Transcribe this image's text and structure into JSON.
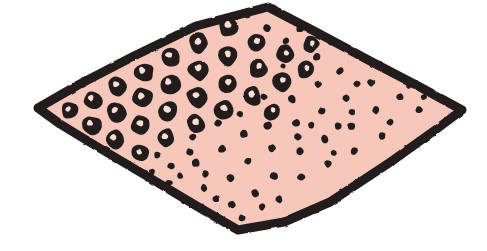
{
  "figure": {
    "canvas": {
      "width": 487,
      "height": 251,
      "background": "#ffffff"
    }
  },
  "colors": {
    "background": "#ffffff",
    "fill": "#f7c9bc",
    "fill_shade": "#f2bfb1",
    "ink": "#231c1a",
    "ink_soft": "#2b2220",
    "hole": "#fbded5"
  },
  "style": {
    "outline_width": 9,
    "ring_outline_width": 5,
    "dot_radius_min": 3,
    "dot_radius_max": 4.6,
    "ring_radius_min": 7,
    "ring_radius_max": 11
  },
  "shape": {
    "name": "rhombus-outline",
    "vertices": [
      {
        "label": "top",
        "x": 268,
        "y": 7
      },
      {
        "label": "right",
        "x": 462,
        "y": 110
      },
      {
        "label": "bottom",
        "x": 238,
        "y": 230
      },
      {
        "label": "left",
        "x": 38,
        "y": 108
      }
    ],
    "path": "M268,7 L316,32 L372,62 L420,87 L462,110 L438,128 L392,161 L330,202 L284,222 L238,230 L200,208 L150,178 L96,146 L60,124 L38,108 L78,85 L134,56 L196,26 Z"
  },
  "legend": {
    "ring_region_label": "annular marks",
    "dot_region_label": "punctate marks"
  },
  "chart_data": {
    "type": "scatter",
    "xlabel": "",
    "ylabel": "",
    "series": [
      {
        "name": "annular marks",
        "marker": "ring",
        "count": 47,
        "points": [
          {
            "x": 228,
            "y": 27,
            "r": 10.0,
            "hx": 228,
            "hy": 25,
            "hr": 3.3
          },
          {
            "x": 199,
            "y": 43,
            "r": 10.2,
            "hx": 198,
            "hy": 41,
            "hr": 3.4
          },
          {
            "x": 256,
            "y": 42,
            "r": 9.6,
            "hx": 257,
            "hy": 41,
            "hr": 3.1
          },
          {
            "x": 171,
            "y": 57,
            "r": 10.4,
            "hx": 169,
            "hy": 55,
            "hr": 3.5
          },
          {
            "x": 228,
            "y": 56,
            "r": 10.0,
            "hx": 228,
            "hy": 54,
            "hr": 3.3
          },
          {
            "x": 285,
            "y": 54,
            "r": 9.4,
            "hx": 286,
            "hy": 53,
            "hr": 3.0
          },
          {
            "x": 144,
            "y": 72,
            "r": 10.2,
            "hx": 142,
            "hy": 70,
            "hr": 3.4
          },
          {
            "x": 199,
            "y": 70,
            "r": 10.6,
            "hx": 198,
            "hy": 68,
            "hr": 3.5
          },
          {
            "x": 258,
            "y": 68,
            "r": 9.8,
            "hx": 259,
            "hy": 66,
            "hr": 3.2
          },
          {
            "x": 306,
            "y": 70,
            "r": 9.2,
            "hx": 307,
            "hy": 68,
            "hr": 2.9
          },
          {
            "x": 118,
            "y": 86,
            "r": 9.8,
            "hx": 116,
            "hy": 84,
            "hr": 3.2
          },
          {
            "x": 170,
            "y": 84,
            "r": 10.6,
            "hx": 168,
            "hy": 82,
            "hr": 3.5
          },
          {
            "x": 228,
            "y": 84,
            "r": 10.2,
            "hx": 228,
            "hy": 82,
            "hr": 3.4
          },
          {
            "x": 282,
            "y": 82,
            "r": 9.6,
            "hx": 283,
            "hy": 80,
            "hr": 3.1
          },
          {
            "x": 93,
            "y": 100,
            "r": 9.4,
            "hx": 91,
            "hy": 98,
            "hr": 3.0
          },
          {
            "x": 143,
            "y": 98,
            "r": 10.4,
            "hx": 141,
            "hy": 96,
            "hr": 3.4
          },
          {
            "x": 197,
            "y": 97,
            "r": 10.8,
            "hx": 196,
            "hy": 95,
            "hr": 3.6
          },
          {
            "x": 252,
            "y": 96,
            "r": 10.2,
            "hx": 252,
            "hy": 94,
            "hr": 3.4
          },
          {
            "x": 70,
            "y": 110,
            "r": 9.0,
            "hx": 68,
            "hy": 109,
            "hr": 2.9
          },
          {
            "x": 117,
            "y": 112,
            "r": 10.0,
            "hx": 115,
            "hy": 110,
            "hr": 3.3
          },
          {
            "x": 168,
            "y": 111,
            "r": 10.6,
            "hx": 167,
            "hy": 109,
            "hr": 3.5
          },
          {
            "x": 224,
            "y": 110,
            "r": 10.4,
            "hx": 224,
            "hy": 108,
            "hr": 3.4
          },
          {
            "x": 92,
            "y": 125,
            "r": 9.6,
            "hx": 90,
            "hy": 123,
            "hr": 3.1
          },
          {
            "x": 141,
            "y": 125,
            "r": 10.2,
            "hx": 140,
            "hy": 123,
            "hr": 3.4
          },
          {
            "x": 196,
            "y": 124,
            "r": 10.0,
            "hx": 196,
            "hy": 122,
            "hr": 3.3
          },
          {
            "x": 114,
            "y": 139,
            "r": 9.8,
            "hx": 113,
            "hy": 137,
            "hr": 3.2
          },
          {
            "x": 166,
            "y": 138,
            "r": 9.6,
            "hx": 165,
            "hy": 136,
            "hr": 3.1
          },
          {
            "x": 140,
            "y": 153,
            "r": 9.2,
            "hx": 139,
            "hy": 152,
            "hr": 3.0
          },
          {
            "x": 311,
            "y": 44,
            "r": 8.4,
            "hx": 312,
            "hy": 43,
            "hr": 2.6
          },
          {
            "x": 272,
            "y": 112,
            "r": 8.6,
            "hx": 273,
            "hy": 110,
            "hr": 2.7
          }
        ]
      },
      {
        "name": "punctate marks",
        "marker": "dot",
        "count": 62,
        "points": [
          {
            "x": 247,
            "y": 14,
            "r": 4.0
          },
          {
            "x": 267,
            "y": 28,
            "r": 3.8
          },
          {
            "x": 286,
            "y": 41,
            "r": 3.6
          },
          {
            "x": 300,
            "y": 29,
            "r": 3.5
          },
          {
            "x": 317,
            "y": 57,
            "r": 3.9
          },
          {
            "x": 340,
            "y": 71,
            "r": 3.8
          },
          {
            "x": 363,
            "y": 57,
            "r": 3.6
          },
          {
            "x": 338,
            "y": 43,
            "r": 3.5
          },
          {
            "x": 371,
            "y": 83,
            "r": 3.9
          },
          {
            "x": 394,
            "y": 69,
            "r": 3.7
          },
          {
            "x": 318,
            "y": 84,
            "r": 4.0
          },
          {
            "x": 292,
            "y": 99,
            "r": 4.2
          },
          {
            "x": 346,
            "y": 98,
            "r": 3.8
          },
          {
            "x": 376,
            "y": 110,
            "r": 4.0
          },
          {
            "x": 400,
            "y": 97,
            "r": 3.7
          },
          {
            "x": 419,
            "y": 110,
            "r": 3.6
          },
          {
            "x": 268,
            "y": 126,
            "r": 4.3
          },
          {
            "x": 296,
            "y": 123,
            "r": 3.9
          },
          {
            "x": 322,
            "y": 111,
            "r": 3.8
          },
          {
            "x": 351,
            "y": 126,
            "r": 4.0
          },
          {
            "x": 382,
            "y": 136,
            "r": 3.8
          },
          {
            "x": 354,
            "y": 151,
            "r": 3.9
          },
          {
            "x": 325,
            "y": 139,
            "r": 4.1
          },
          {
            "x": 300,
            "y": 151,
            "r": 4.0
          },
          {
            "x": 272,
            "y": 148,
            "r": 3.9
          },
          {
            "x": 244,
            "y": 134,
            "r": 4.2
          },
          {
            "x": 222,
            "y": 149,
            "r": 4.1
          },
          {
            "x": 196,
            "y": 163,
            "r": 4.0
          },
          {
            "x": 171,
            "y": 166,
            "r": 3.8
          },
          {
            "x": 248,
            "y": 161,
            "r": 4.0
          },
          {
            "x": 274,
            "y": 176,
            "r": 4.1
          },
          {
            "x": 301,
            "y": 177,
            "r": 3.9
          },
          {
            "x": 328,
            "y": 164,
            "r": 3.8
          },
          {
            "x": 230,
            "y": 178,
            "r": 4.0
          },
          {
            "x": 204,
            "y": 188,
            "r": 3.8
          },
          {
            "x": 255,
            "y": 193,
            "r": 4.0
          },
          {
            "x": 279,
            "y": 199,
            "r": 3.9
          },
          {
            "x": 232,
            "y": 205,
            "r": 4.0
          },
          {
            "x": 216,
            "y": 199,
            "r": 3.6
          },
          {
            "x": 242,
            "y": 218,
            "r": 3.7
          },
          {
            "x": 169,
            "y": 183,
            "r": 3.6
          },
          {
            "x": 190,
            "y": 152,
            "r": 3.7
          },
          {
            "x": 218,
            "y": 123,
            "r": 3.8
          },
          {
            "x": 193,
            "y": 137,
            "r": 3.6
          },
          {
            "x": 157,
            "y": 155,
            "r": 3.4
          },
          {
            "x": 152,
            "y": 172,
            "r": 3.3
          },
          {
            "x": 338,
            "y": 126,
            "r": 3.5
          },
          {
            "x": 409,
            "y": 85,
            "r": 3.4
          },
          {
            "x": 424,
            "y": 97,
            "r": 3.3
          },
          {
            "x": 370,
            "y": 44,
            "r": 3.2
          },
          {
            "x": 283,
            "y": 66,
            "r": 3.0
          },
          {
            "x": 264,
            "y": 97,
            "r": 3.6
          },
          {
            "x": 240,
            "y": 114,
            "r": 3.5
          },
          {
            "x": 298,
            "y": 137,
            "r": 3.7
          },
          {
            "x": 352,
            "y": 112,
            "r": 3.4
          },
          {
            "x": 390,
            "y": 122,
            "r": 3.5
          },
          {
            "x": 357,
            "y": 84,
            "r": 3.3
          },
          {
            "x": 311,
            "y": 125,
            "r": 3.4
          },
          {
            "x": 205,
            "y": 174,
            "r": 3.5
          },
          {
            "x": 262,
            "y": 207,
            "r": 3.4
          },
          {
            "x": 180,
            "y": 176,
            "r": 3.2
          },
          {
            "x": 334,
            "y": 153,
            "r": 3.3
          }
        ]
      }
    ]
  }
}
